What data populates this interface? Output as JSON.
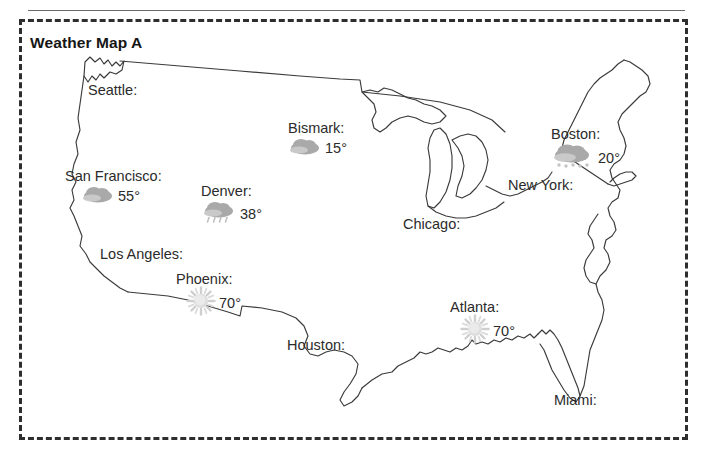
{
  "title": "Weather Map A",
  "colors": {
    "border": "#2e2e2e",
    "rule": "#6b6b6b",
    "coastline": "#3a3a3a",
    "text": "#2b2b2b",
    "cloud": "#a9a9a9",
    "cloud_light": "#c9c9c9",
    "sun": "#d0d0d0",
    "precip": "#bdbdbd"
  },
  "map": {
    "region": "United States",
    "outline_style": "line-drawing"
  },
  "cities": [
    {
      "id": "seattle",
      "name": "Seattle:",
      "temp": "",
      "icon": "none",
      "x": 88,
      "y": 82
    },
    {
      "id": "san-francisco",
      "name": "San Francisco:",
      "temp": "55°",
      "icon": "cloud",
      "x": 65,
      "y": 168
    },
    {
      "id": "los-angeles",
      "name": "Los Angeles:",
      "temp": "",
      "icon": "none",
      "x": 100,
      "y": 246
    },
    {
      "id": "phoenix",
      "name": "Phoenix:",
      "temp": "70°",
      "icon": "sun",
      "x": 176,
      "y": 271
    },
    {
      "id": "denver",
      "name": "Denver:",
      "temp": "38°",
      "icon": "cloud-rain",
      "x": 201,
      "y": 183
    },
    {
      "id": "bismark",
      "name": "Bismark:",
      "temp": "15°",
      "icon": "cloud",
      "x": 288,
      "y": 120
    },
    {
      "id": "houston",
      "name": "Houston:",
      "temp": "",
      "icon": "none",
      "x": 287,
      "y": 337
    },
    {
      "id": "chicago",
      "name": "Chicago:",
      "temp": "",
      "icon": "none",
      "x": 403,
      "y": 216
    },
    {
      "id": "atlanta",
      "name": "Atlanta:",
      "temp": "70°",
      "icon": "sun",
      "x": 450,
      "y": 299
    },
    {
      "id": "boston",
      "name": "Boston:",
      "temp": "20°",
      "icon": "cloud-snow",
      "x": 551,
      "y": 126
    },
    {
      "id": "new-york",
      "name": "New York:",
      "temp": "",
      "icon": "none",
      "x": 508,
      "y": 177
    },
    {
      "id": "miami",
      "name": "Miami:",
      "temp": "",
      "icon": "none",
      "x": 554,
      "y": 392
    }
  ]
}
